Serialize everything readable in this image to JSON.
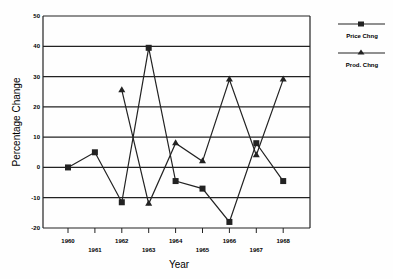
{
  "chart_data": {
    "type": "line",
    "title": "",
    "xlabel": "Year",
    "ylabel": "Percentage Change",
    "ylim": [
      -20,
      50
    ],
    "yticks": [
      50,
      40,
      30,
      20,
      10,
      0,
      -10,
      -20
    ],
    "grid": "horizontal",
    "legend_position": "right",
    "categories": [
      "1960",
      "1961",
      "1962",
      "1963",
      "1964",
      "1965",
      "1966",
      "1967",
      "1968"
    ],
    "series": [
      {
        "name": "Price Chng",
        "marker": "square",
        "values": [
          0,
          5,
          -11.5,
          39.5,
          -4.5,
          -7,
          -18,
          8,
          -4.5
        ]
      },
      {
        "name": "Prod. Chng",
        "marker": "triangle",
        "values": [
          null,
          null,
          25.5,
          -12,
          8,
          2,
          29,
          4,
          29
        ]
      }
    ]
  },
  "legend": {
    "items": [
      {
        "label": "Price Chng"
      },
      {
        "label": "Prod. Chng"
      }
    ]
  }
}
